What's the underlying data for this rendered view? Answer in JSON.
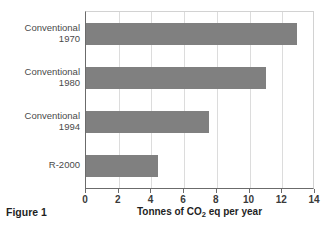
{
  "figure": {
    "caption": "Figure 1"
  },
  "chart_data": {
    "type": "bar",
    "orientation": "horizontal",
    "title": "",
    "categories": [
      "Conventional 1970",
      "Conventional 1980",
      "Conventional 1994",
      "R-2000"
    ],
    "category_lines": [
      {
        "line1": "Conventional",
        "line2": "1970"
      },
      {
        "line1": "Conventional",
        "line2": "1980"
      },
      {
        "line1": "Conventional",
        "line2": "1994"
      },
      {
        "line1": "R-2000",
        "line2": ""
      }
    ],
    "values": [
      12.9,
      11.0,
      7.5,
      4.4
    ],
    "xlabel": "Tonnes of CO2 eq per year",
    "xlabel_parts": {
      "before": "Tonnes of CO",
      "sub": "2",
      "after": " eq per year"
    },
    "ylabel": "",
    "xlim": [
      0,
      14
    ],
    "xticks": [
      0,
      2,
      4,
      6,
      8,
      10,
      12,
      14
    ],
    "xtick_labels": [
      "0",
      "2",
      "4",
      "6",
      "8",
      "10",
      "12",
      "14"
    ],
    "grid": true,
    "legend": false,
    "bar_color": "#808080",
    "gridline_color": "#dcdcdc",
    "axis_color": "#6b6b6b"
  }
}
